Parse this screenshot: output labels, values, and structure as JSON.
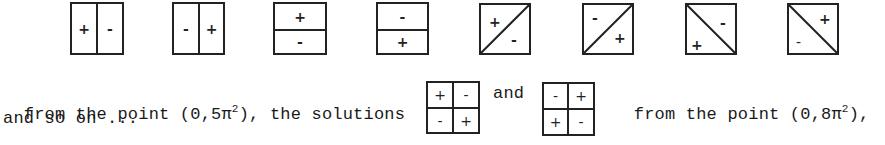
{
  "top_row": [
    {
      "type": "vsplit",
      "left": "+",
      "right": "-"
    },
    {
      "type": "vsplit",
      "left": "-",
      "right": "+"
    },
    {
      "type": "hsplit",
      "top": "+",
      "bottom": "-"
    },
    {
      "type": "hsplit",
      "top": "-",
      "bottom": "+"
    },
    {
      "type": "diag-up",
      "upper_left": "+",
      "lower_right": "-"
    },
    {
      "type": "diag-up",
      "upper_left": "-",
      "lower_right": "+"
    },
    {
      "type": "diag-down",
      "upper_right": "-",
      "lower_left": "+"
    },
    {
      "type": "diag-down",
      "upper_right": "+",
      "lower_left": "-"
    }
  ],
  "text": {
    "line1_part1": "from the point (0,5π",
    "line1_exp1": "2",
    "line1_part2": "), the solutions",
    "and": "and",
    "line1_part3": "from the point (0,8π",
    "line1_exp2": "2",
    "line1_part4": "),",
    "line2": "and so on ..."
  },
  "quad_boxes": [
    {
      "tl": "+",
      "tr": "-",
      "bl": "-",
      "br": "+"
    },
    {
      "tl": "-",
      "tr": "+",
      "bl": "+",
      "br": "-"
    }
  ]
}
